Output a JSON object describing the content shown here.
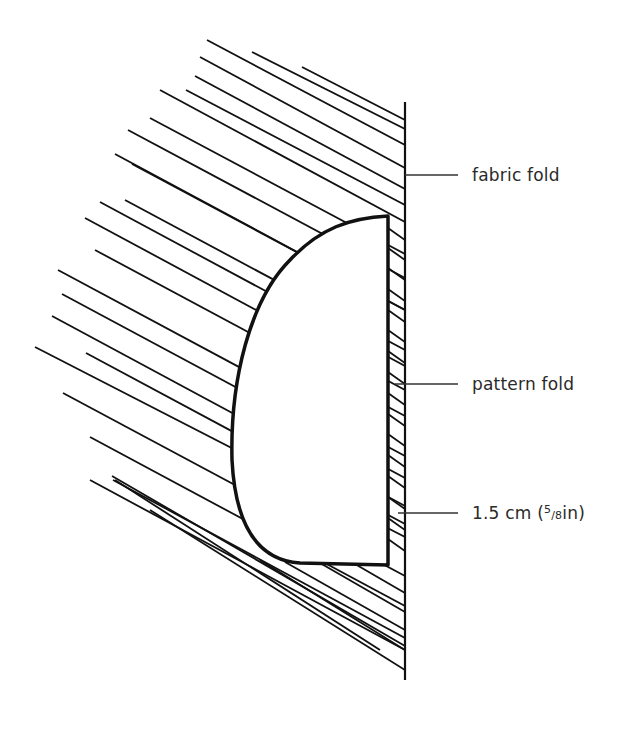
{
  "diagram": {
    "title": "",
    "labels": {
      "fabric_fold": "fabric fold",
      "pattern_fold": "pattern fold",
      "seam_allowance_prefix": "1.5 cm (",
      "seam_allowance_num": "5",
      "seam_allowance_slash": "/",
      "seam_allowance_den": "8",
      "seam_allowance_suffix": "in)"
    },
    "colors": {
      "line": "#111111",
      "text": "#2a2a2a",
      "background": "#ffffff"
    }
  }
}
